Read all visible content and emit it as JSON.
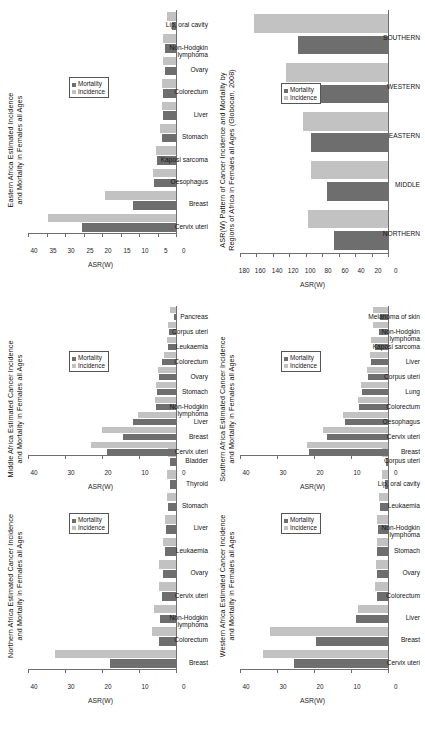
{
  "figure": {
    "legend": {
      "mortality": "Mortality",
      "incidence": "Incidence"
    },
    "axis_name": "ASR(W)"
  },
  "chart_data": [
    {
      "id": "northern",
      "type": "bar",
      "title": "Northern Africa Estimated Cancer Incidence and Mortality in Females all Ages",
      "title_line1": "Northern Africa Estimated Cancer Incidence",
      "title_line2": "and Mortality in Females all Ages",
      "xlabel": "",
      "ylabel": "ASR(W)",
      "ylim": [
        0,
        40
      ],
      "yticks": [
        0,
        10,
        20,
        30,
        40
      ],
      "grid": false,
      "legend_position": "inner-right",
      "categories": [
        "Breast",
        "Colorectum",
        "Non-Hodgkin lymphoma",
        "Cervix uteri",
        "Ovary",
        "Leukaemia",
        "Liver",
        "Stomach",
        "Thyroid",
        "Bladder"
      ],
      "series": [
        {
          "name": "Incidence",
          "values": [
            32.7,
            6.4,
            6.0,
            4.6,
            4.5,
            3.6,
            3.0,
            2.5,
            2.4,
            2.3
          ]
        },
        {
          "name": "Mortality",
          "values": [
            17.9,
            4.6,
            4.2,
            3.7,
            3.5,
            3.0,
            2.8,
            2.2,
            1.7,
            1.6
          ]
        }
      ]
    },
    {
      "id": "middle",
      "type": "bar",
      "title": "Middle Africa Estimated Cancer Incidence and Mortality in Females all Ages",
      "title_line1": "Middle Africa Estimated Cancer Incidence",
      "title_line2": "and Mortality in Females all Ages",
      "xlabel": "",
      "ylabel": "ASR(W)",
      "ylim": [
        0,
        40
      ],
      "yticks": [
        0,
        10,
        20,
        30,
        40
      ],
      "grid": false,
      "legend_position": "inner-right",
      "categories": [
        "Cervix uteri",
        "Breast",
        "Liver",
        "Non-Hodgkin lymphoma",
        "Stomach",
        "Ovary",
        "Colorectum",
        "Leukaemia",
        "Corpus uteri",
        "Pancreas"
      ],
      "series": [
        {
          "name": "Incidence",
          "values": [
            23.0,
            20.1,
            10.4,
            5.6,
            5.4,
            4.9,
            3.3,
            2.4,
            2.2,
            1.5
          ]
        },
        {
          "name": "Mortality",
          "values": [
            18.6,
            14.3,
            11.5,
            5.4,
            5.2,
            4.6,
            3.8,
            2.3,
            1.9,
            0.5
          ]
        }
      ]
    },
    {
      "id": "eastern",
      "type": "bar",
      "title": "Eastern Africa Estimated Incidence and Mortality in Females all Ages",
      "title_line1": "Eastern Africa Estimated Incidence",
      "title_line2": "and Mortality in Females all Ages",
      "xlabel": "",
      "ylabel": "ASR(W)",
      "ylim": [
        0,
        40
      ],
      "yticks": [
        0,
        5,
        10,
        15,
        20,
        25,
        30,
        35,
        40
      ],
      "grid": false,
      "legend_position": "inner-right",
      "categories": [
        "Cervix uteri",
        "Breast",
        "Oesophagus",
        "Kaposi sarcoma",
        "Stomach",
        "Liver",
        "Colorectum",
        "Ovary",
        "Non-Hodgkin lymphoma",
        "Lip, oral cavity"
      ],
      "series": [
        {
          "name": "Incidence",
          "values": [
            34.5,
            19.3,
            6.2,
            5.3,
            4.2,
            3.9,
            3.9,
            3.5,
            3.4,
            2.4
          ]
        },
        {
          "name": "Mortality",
          "values": [
            25.3,
            11.7,
            5.9,
            5.1,
            3.7,
            3.6,
            3.6,
            3.1,
            3.0,
            1.2
          ]
        }
      ]
    },
    {
      "id": "western",
      "type": "bar",
      "title": "Western Africa Estimated Cancer Incidence and Mortality in Females all Ages",
      "title_line1": "Western Africa Estimated Cancer Incidence",
      "title_line2": "and Mortality in Females all Ages",
      "xlabel": "",
      "ylabel": "ASR(W)",
      "ylim": [
        0,
        40
      ],
      "yticks": [
        0,
        10,
        20,
        30,
        40
      ],
      "grid": false,
      "legend_position": "inner-right",
      "categories": [
        "Cervix uteri",
        "Breast",
        "Liver",
        "Colorectum",
        "Ovary",
        "Stomach",
        "Non-Hodgkin lymphoma",
        "Leukaemia",
        "Lip, oral cavity",
        "Corpus uteri"
      ],
      "series": [
        {
          "name": "Incidence",
          "values": [
            33.7,
            31.8,
            8.0,
            3.5,
            3.2,
            3.0,
            2.9,
            2.4,
            1.6,
            1.5
          ]
        },
        {
          "name": "Mortality",
          "values": [
            25.3,
            19.4,
            8.6,
            3.1,
            3.0,
            3.0,
            2.6,
            2.3,
            0.9,
            0.6
          ]
        }
      ]
    },
    {
      "id": "southern",
      "type": "bar",
      "title": "Southern Africa Estimated Cancer Incidence and Mortality in Females all Ages",
      "title_line1": "Southern Africa Estimated Cancer Incidence",
      "title_line2": "and Mortality in Females all Ages",
      "xlabel": "",
      "ylabel": "ASR(W)",
      "ylim": [
        0,
        40
      ],
      "yticks": [
        0,
        10,
        20,
        30,
        40
      ],
      "grid": false,
      "legend_position": "inner-right",
      "categories": [
        "Breast",
        "Cervix uteri",
        "Oesophagus",
        "Colorectum",
        "Lung",
        "Corpus uteri",
        "Liver",
        "Kaposi sarcoma",
        "Non-Hodgkin lymphoma",
        "Melanoma of skin"
      ],
      "series": [
        {
          "name": "Incidence",
          "values": [
            21.8,
            17.6,
            12.1,
            8.2,
            7.4,
            5.8,
            4.9,
            4.5,
            4.1,
            4.0
          ]
        },
        {
          "name": "Mortality",
          "values": [
            21.4,
            16.4,
            11.6,
            7.8,
            6.9,
            5.4,
            4.6,
            3.6,
            2.4,
            2.2
          ]
        }
      ]
    },
    {
      "id": "regions",
      "type": "bar",
      "title": "ASR(W) Pattern of Cancer Incidence and Mortality by Regions of Africa in Females all Ages (Globocan, 2008)",
      "title_line1": "ASR(W) Pattern of Cancer Incidence and Mortality by",
      "title_line2": "Regions of Africa in Females all Ages (Globocan, 2008)",
      "xlabel": "",
      "ylabel": "ASR(W)",
      "ylim": [
        0,
        180
      ],
      "yticks": [
        0,
        20,
        40,
        60,
        80,
        100,
        120,
        140,
        160,
        180
      ],
      "grid": false,
      "legend_position": "inner-right",
      "categories": [
        "NORTHERN",
        "MIDDLE",
        "EASTERN",
        "WESTERN",
        "SOUTHERN"
      ],
      "series": [
        {
          "name": "Incidence",
          "values": [
            97.0,
            94.0,
            104.0,
            124.0,
            163.0
          ]
        },
        {
          "name": "Mortality",
          "values": [
            66.0,
            74.0,
            94.0,
            88.0,
            109.0
          ]
        }
      ]
    }
  ]
}
